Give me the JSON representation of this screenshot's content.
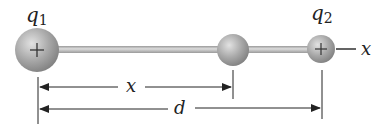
{
  "diagram": {
    "charges": [
      {
        "label": "q",
        "subscript": "1",
        "sign": "+",
        "cx": 37,
        "cy": 50,
        "r": 22
      },
      {
        "label": "",
        "subscript": "",
        "sign": "",
        "cx": 233,
        "cy": 50,
        "r": 16
      },
      {
        "label": "q",
        "subscript": "2",
        "sign": "+",
        "cx": 321,
        "cy": 49,
        "r": 14
      }
    ],
    "axis_label": "x",
    "dimensions": {
      "x_label": "x",
      "d_label": "d"
    },
    "colors": {
      "sphere": "#a8a8a8",
      "rod": "#bdbdbd",
      "line": "#222222"
    }
  }
}
